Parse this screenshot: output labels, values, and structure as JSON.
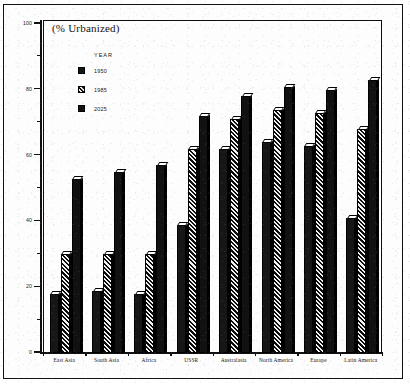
{
  "chart_data": {
    "type": "bar",
    "title": "(% Urbanized)",
    "xlabel": "",
    "ylabel": "",
    "ylim": [
      0,
      100
    ],
    "grid": false,
    "legend_position": "upper-left-inside",
    "legend_title": "YEAR",
    "categories": [
      "East Asia",
      "South Asia",
      "Africa",
      "USSR",
      "Australasia",
      "North America",
      "Europe",
      "Latin America"
    ],
    "ytick_labels": [
      "0",
      "20",
      "40",
      "60",
      "80",
      "100"
    ],
    "ytick_values": [
      0,
      20,
      40,
      60,
      80,
      100
    ],
    "yminor_values": [
      10,
      30,
      50,
      70,
      90
    ],
    "series": [
      {
        "name": "1950",
        "style": "solid",
        "values": [
          18,
          19,
          18,
          39,
          62,
          64,
          63,
          41
        ]
      },
      {
        "name": "1985",
        "style": "hatched",
        "values": [
          30,
          30,
          30,
          62,
          71,
          74,
          73,
          68
        ]
      },
      {
        "name": "2025",
        "style": "solid",
        "values": [
          53,
          55,
          57,
          72,
          78,
          81,
          80,
          83
        ]
      }
    ]
  },
  "figure": {
    "scan_mark": ""
  }
}
